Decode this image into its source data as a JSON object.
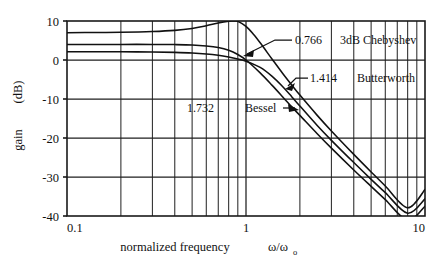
{
  "chart_data": {
    "type": "line",
    "title": "",
    "subtitle": "",
    "xlabel": "normalized frequency   ω/ωₒ",
    "xlabel_main": "normalized frequency",
    "xlabel_symbol": "ω/ω",
    "xlabel_symbol_sub": "o",
    "ylabel": "gain  (dB)",
    "xscale": "log",
    "yscale": "linear",
    "xlim": [
      0.1,
      10
    ],
    "ylim": [
      -40,
      10
    ],
    "grid": true,
    "grid_style": "log-minor-vertical + major-horizontal",
    "legend_position": "inline-annotations",
    "xticks": [
      0.1,
      1,
      10
    ],
    "xtick_labels": [
      "0.1",
      "1",
      "10"
    ],
    "yticks": [
      10,
      0,
      -10,
      -20,
      -30,
      -40
    ],
    "ytick_labels": [
      "10",
      "0",
      "-10",
      "-20",
      "-30",
      "-40"
    ],
    "series": [
      {
        "name": "3dB Chebyshev",
        "q": "0.766",
        "q_label": "0.766",
        "x": [
          0.1,
          0.15,
          0.2,
          0.3,
          0.4,
          0.5,
          0.6,
          0.7,
          0.8,
          0.85,
          0.9,
          1.0,
          1.1,
          1.2,
          1.4,
          1.6,
          1.8,
          2.0,
          2.5,
          3.0,
          4.0,
          5.0,
          6.0,
          8.0,
          10.0
        ],
        "y": [
          7.0,
          7.05,
          7.1,
          7.3,
          7.6,
          8.1,
          8.8,
          9.5,
          9.95,
          10.0,
          9.9,
          8.6,
          6.6,
          4.4,
          0.2,
          -3.4,
          -6.4,
          -9.0,
          -14.2,
          -18.2,
          -24.2,
          -28.7,
          -32.3,
          -37.9,
          -33.2
        ]
      },
      {
        "name": "Butterworth",
        "q": "1.414",
        "q_label": "1.414",
        "x": [
          0.1,
          0.15,
          0.2,
          0.3,
          0.4,
          0.5,
          0.6,
          0.7,
          0.8,
          0.9,
          1.0,
          1.2,
          1.4,
          1.6,
          1.8,
          2.0,
          2.5,
          3.0,
          4.0,
          5.0,
          6.0,
          8.0,
          10.0
        ],
        "y": [
          4.0,
          4.0,
          4.0,
          4.0,
          3.95,
          3.85,
          3.6,
          3.2,
          2.5,
          1.4,
          0.0,
          -3.3,
          -6.5,
          -9.4,
          -12.0,
          -14.2,
          -18.9,
          -22.6,
          -28.2,
          -32.4,
          -35.8,
          -41.1,
          -37.5
        ]
      },
      {
        "name": "Bessel",
        "q": "1.732",
        "q_label": "1.732",
        "x": [
          0.1,
          0.15,
          0.2,
          0.3,
          0.4,
          0.5,
          0.6,
          0.7,
          0.8,
          0.9,
          1.0,
          1.2,
          1.4,
          1.6,
          1.8,
          2.0,
          2.5,
          3.0,
          4.0,
          5.0,
          6.0,
          8.0,
          10.0
        ],
        "y": [
          2.1,
          2.1,
          2.1,
          2.05,
          1.95,
          1.8,
          1.55,
          1.2,
          0.75,
          0.25,
          -0.3,
          -1.9,
          -4.2,
          -6.8,
          -9.4,
          -11.8,
          -16.8,
          -20.6,
          -26.3,
          -30.6,
          -34.0,
          -39.3,
          -35.6
        ]
      }
    ],
    "annotations": [
      {
        "text": "0.766",
        "name": "q-label-chebyshev"
      },
      {
        "text": "3dB Chebyshev",
        "name": "series-label-chebyshev"
      },
      {
        "text": "1.414",
        "name": "q-label-butterworth"
      },
      {
        "text": "Butterworth",
        "name": "series-label-butterworth"
      },
      {
        "text": "1.732",
        "name": "q-label-bessel"
      },
      {
        "text": "Bessel",
        "name": "series-label-bessel"
      }
    ]
  },
  "axes": {
    "y_title_gain": "gain",
    "y_title_unit": "(dB)",
    "y_ticks": [
      "10",
      "0",
      "-10",
      "-20",
      "-30",
      "-40"
    ],
    "x_ticks": [
      "0.1",
      "1",
      "10"
    ],
    "x_title_text": "normalized frequency",
    "x_title_symbol": "ω/ω",
    "x_title_symbol_sub": "o"
  },
  "labels": {
    "chebyshev_q": "0.766",
    "chebyshev_name": "3dB Chebyshev",
    "butterworth_q": "1.414",
    "butterworth_name": "Butterworth",
    "bessel_q": "1.732",
    "bessel_name": "Bessel"
  },
  "colors": {
    "background": "#ffffff",
    "ink": "#111111",
    "grid": "#2a2a2a"
  }
}
